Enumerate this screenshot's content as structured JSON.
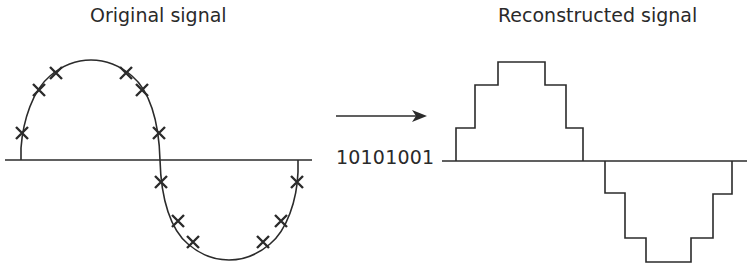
{
  "diagram": {
    "left": {
      "title": "Original signal",
      "description": "Analog sine wave with 12 sample points marked by crosses",
      "baseline": {
        "x1": 5,
        "x2": 312,
        "y": 160
      },
      "sample_marker": "cross-mark",
      "samples": [
        {
          "x": 22,
          "y": 133
        },
        {
          "x": 39,
          "y": 90
        },
        {
          "x": 56,
          "y": 73
        },
        {
          "x": 126,
          "y": 73
        },
        {
          "x": 142,
          "y": 90
        },
        {
          "x": 159,
          "y": 133
        },
        {
          "x": 161,
          "y": 182
        },
        {
          "x": 178,
          "y": 221
        },
        {
          "x": 193,
          "y": 242
        },
        {
          "x": 263,
          "y": 242
        },
        {
          "x": 281,
          "y": 221
        },
        {
          "x": 297,
          "y": 182
        }
      ]
    },
    "middle": {
      "arrow": "right-arrow",
      "bit_string": "10101001"
    },
    "right": {
      "title": "Reconstructed signal",
      "description": "Staircase approximation of the sine wave",
      "baseline": {
        "x1": 442,
        "x2": 747,
        "y": 161
      },
      "step_levels": [
        1,
        2,
        3,
        2,
        1,
        -1,
        -2,
        -3,
        -2,
        -1
      ]
    }
  },
  "colors": {
    "stroke": "#2b2b2b",
    "background": "#ffffff"
  }
}
